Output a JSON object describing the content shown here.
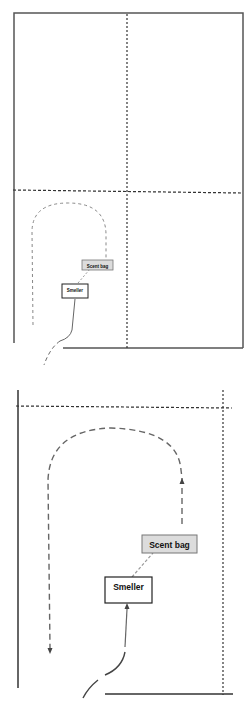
{
  "diagram": {
    "panels": [
      {
        "name": "overview",
        "scent_bag_label": "Scent bag",
        "smeller_label": "Smeller"
      },
      {
        "name": "detail",
        "scent_bag_label": "Scent bag",
        "smeller_label": "Smeller"
      }
    ],
    "colors": {
      "line": "#555555",
      "box_border": "#222222",
      "scent_bag_fill": "#dcdcdc",
      "smeller_fill": "#ffffff",
      "path": "#666666"
    }
  }
}
